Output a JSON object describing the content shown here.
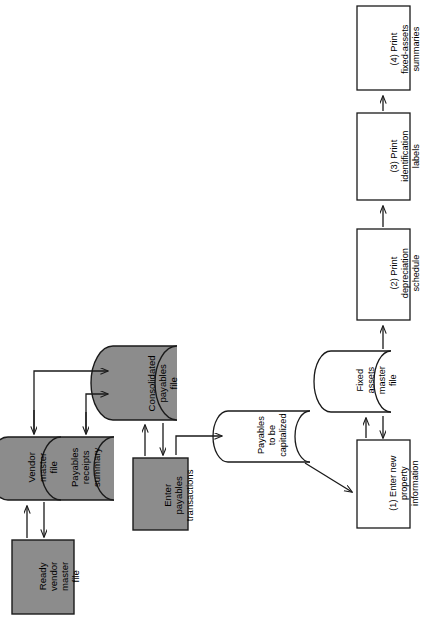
{
  "diagram": {
    "orientation": "rotated-90-ccw",
    "palette": {
      "shape_fill_shaded": "#8c8c8c",
      "shape_fill_plain": "#ffffff",
      "stroke": "#1a1a1a",
      "text": "#000000",
      "background": "#ffffff"
    },
    "nodes": [
      {
        "id": "ready-vendor-master-file",
        "type": "process-box",
        "shaded": true,
        "lines": [
          "Ready",
          "vendor",
          "master",
          "file"
        ]
      },
      {
        "id": "vendor-master-file",
        "type": "cylinder",
        "shaded": true,
        "lines": [
          "Vendor",
          "master",
          "file"
        ]
      },
      {
        "id": "payables-receipts-summary",
        "type": "cylinder",
        "shaded": true,
        "lines": [
          "Payables",
          "receipts",
          "summary"
        ]
      },
      {
        "id": "consolidated-payables-file",
        "type": "cylinder",
        "shaded": true,
        "lines": [
          "Consolidated",
          "payables",
          "file"
        ]
      },
      {
        "id": "enter-payables-transactions",
        "type": "process-box",
        "shaded": true,
        "lines": [
          "Enter",
          "payables",
          "transactions"
        ]
      },
      {
        "id": "payables-to-be-capitalized",
        "type": "cylinder",
        "shaded": false,
        "lines": [
          "Payables",
          "to be",
          "capitalized"
        ]
      },
      {
        "id": "fixed-assets-master-file",
        "type": "cylinder",
        "shaded": false,
        "lines": [
          "Fixed",
          "assets",
          "master",
          "file"
        ]
      },
      {
        "id": "step-1-enter-new-property-information",
        "type": "process-box",
        "shaded": false,
        "lines": [
          "(1) Enter new",
          "property",
          "information"
        ]
      },
      {
        "id": "step-2-print-depreciation-schedule",
        "type": "process-box",
        "shaded": false,
        "lines": [
          "(2) Print",
          "depreciation",
          "schedule"
        ]
      },
      {
        "id": "step-3-print-identification-labels",
        "type": "process-box",
        "shaded": false,
        "lines": [
          "(3) Print",
          "identification",
          "labels"
        ]
      },
      {
        "id": "step-4-print-fixed-assets-summaries",
        "type": "process-box",
        "shaded": false,
        "lines": [
          "(4) Print",
          "fixed-assets",
          "summaries"
        ]
      }
    ],
    "labels": {
      "ready_vendor_master_file": "Ready\nvendor\nmaster\nfile",
      "ready_l1": "Ready",
      "ready_l2": "vendor",
      "ready_l3": "master",
      "ready_l4": "file",
      "vendor_l1": "Vendor",
      "vendor_l2": "master",
      "vendor_l3": "file",
      "payrec_l1": "Payables",
      "payrec_l2": "receipts",
      "payrec_l3": "summary",
      "consol_l1": "Consolidated",
      "consol_l2": "payables",
      "consol_l3": "file",
      "enterpay_l1": "Enter",
      "enterpay_l2": "payables",
      "enterpay_l3": "transactions",
      "paycap_l1": "Payables",
      "paycap_l2": "to be",
      "paycap_l3": "capitalized",
      "fixed_l1": "Fixed",
      "fixed_l2": "assets",
      "fixed_l3": "master",
      "fixed_l4": "file",
      "step1_l1": "(1) Enter new",
      "step1_l2": "property",
      "step1_l3": "information",
      "step2_l1": "(2) Print",
      "step2_l2": "depreciation",
      "step2_l3": "schedule",
      "step3_l1": "(3) Print",
      "step3_l2": "identification",
      "step3_l3": "labels",
      "step4_l1": "(4) Print",
      "step4_l2": "fixed-assets",
      "step4_l3": "summaries"
    },
    "edges": [
      {
        "from": "ready-vendor-master-file",
        "to": "vendor-master-file",
        "style": "double-arrow"
      },
      {
        "from": "vendor-master-file",
        "to": "consolidated-payables-file",
        "style": "elbow-arrow"
      },
      {
        "from": "payables-receipts-summary",
        "to": "consolidated-payables-file",
        "style": "elbow-arrow"
      },
      {
        "from": "enter-payables-transactions",
        "to": "consolidated-payables-file",
        "style": "double-arrow"
      },
      {
        "from": "enter-payables-transactions",
        "to": "payables-to-be-capitalized",
        "style": "elbow-arrow"
      },
      {
        "from": "payables-to-be-capitalized",
        "to": "step-1-enter-new-property-information",
        "style": "diagonal-arrow"
      },
      {
        "from": "step-1-enter-new-property-information",
        "to": "fixed-assets-master-file",
        "style": "double-arrow"
      },
      {
        "from": "fixed-assets-master-file",
        "to": "step-2-print-depreciation-schedule",
        "style": "arrow"
      },
      {
        "from": "step-2-print-depreciation-schedule",
        "to": "step-3-print-identification-labels",
        "style": "arrow"
      },
      {
        "from": "step-3-print-identification-labels",
        "to": "step-4-print-fixed-assets-summaries",
        "style": "arrow"
      }
    ]
  }
}
